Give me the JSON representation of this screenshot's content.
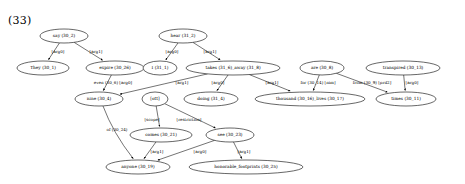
{
  "figure": {
    "example_number": "(33)",
    "type": "semantic-dependency-graph",
    "width": 465,
    "height": 184,
    "background": "#ffffff",
    "stroke_color": "#000000"
  },
  "nodes": [
    {
      "id": "say",
      "label": "say (30_2)",
      "cx": 64,
      "cy": 36,
      "rx": 24,
      "ry": 7
    },
    {
      "id": "hear",
      "label": "hear (31_2)",
      "cx": 183,
      "cy": 36,
      "rx": 24,
      "ry": 7
    },
    {
      "id": "they",
      "label": "They (30_1)",
      "cx": 43,
      "cy": 68,
      "rx": 26,
      "ry": 7
    },
    {
      "id": "expire",
      "label": "expire (30_26)",
      "cx": 115,
      "cy": 68,
      "rx": 29,
      "ry": 7
    },
    {
      "id": "i",
      "label": "I (31_1)",
      "cx": 160,
      "cy": 68,
      "rx": 17,
      "ry": 7
    },
    {
      "id": "takes_away",
      "label": "takes (31_6)_away (31_8)",
      "cx": 233,
      "cy": 68,
      "rx": 47,
      "ry": 7
    },
    {
      "id": "are",
      "label": "are (30_8)",
      "cx": 322,
      "cy": 68,
      "rx": 22,
      "ry": 7
    },
    {
      "id": "transpired",
      "label": "transpired (30_13)",
      "cx": 403,
      "cy": 68,
      "rx": 37,
      "ry": 7
    },
    {
      "id": "nine",
      "label": "nine (30_4)",
      "cx": 99,
      "cy": 99,
      "rx": 24,
      "ry": 7
    },
    {
      "id": "ott",
      "label": "[ott]",
      "cx": 155,
      "cy": 99,
      "rx": 13,
      "ry": 7
    },
    {
      "id": "doing",
      "label": "doing (31_4)",
      "cx": 211,
      "cy": 99,
      "rx": 27,
      "ry": 7
    },
    {
      "id": "thousand",
      "label": "thousand (30_16)_lives (30_17)",
      "cx": 310,
      "cy": 99,
      "rx": 55,
      "ry": 7
    },
    {
      "id": "times",
      "label": "times (30_11)",
      "cx": 406,
      "cy": 99,
      "rx": 30,
      "ry": 7
    },
    {
      "id": "comes",
      "label": "comes (30_21)",
      "cx": 161,
      "cy": 135,
      "rx": 31,
      "ry": 7
    },
    {
      "id": "see",
      "label": "see (30_23)",
      "cx": 230,
      "cy": 135,
      "rx": 24,
      "ry": 7
    },
    {
      "id": "anyone",
      "label": "anyone (30_19)",
      "cx": 138,
      "cy": 167,
      "rx": 32,
      "ry": 7
    },
    {
      "id": "footprints",
      "label": "honorable_footprints (30_25)",
      "cx": 246,
      "cy": 167,
      "rx": 57,
      "ry": 7
    }
  ],
  "edges": [
    {
      "from": "say",
      "to": "they",
      "label": "[arg0]",
      "lx": 58,
      "ly": 52
    },
    {
      "from": "say",
      "to": "expire",
      "label": "[arg1]",
      "lx": 96,
      "ly": 52
    },
    {
      "from": "hear",
      "to": "i",
      "label": "[arg0]",
      "lx": 172,
      "ly": 52
    },
    {
      "from": "hear",
      "to": "takes_away",
      "label": "[arg1]",
      "lx": 210,
      "ly": 52
    },
    {
      "from": "expire",
      "to": "nine",
      "label": "even (30_6) [arg0]",
      "lx": 113,
      "ly": 83
    },
    {
      "from": "takes_away",
      "to": "nine",
      "label": "[arg1]",
      "lx": 182,
      "ly": 83
    },
    {
      "from": "takes_away",
      "to": "doing",
      "label": "[arg0]",
      "lx": 218,
      "ly": 83
    },
    {
      "from": "takes_away",
      "to": "thousand",
      "label": "[arg1]",
      "lx": 272,
      "ly": 83
    },
    {
      "from": "are",
      "to": "thousand",
      "label": "for (30_14) [nim]",
      "lx": 318,
      "ly": 83
    },
    {
      "from": "are",
      "to": "times",
      "label": "from (30_9) [prd2]",
      "lx": 372,
      "ly": 83
    },
    {
      "from": "transpired",
      "to": "times",
      "label": "[arg0]",
      "lx": 412,
      "ly": 83
    },
    {
      "from": "nine",
      "to": "anyone",
      "label": "of (30_24)",
      "lx": 117,
      "ly": 130
    },
    {
      "from": "ott",
      "to": "comes",
      "label": "[scope]",
      "lx": 152,
      "ly": 120
    },
    {
      "from": "ott",
      "to": "see",
      "label": "[restriction]",
      "lx": 189,
      "ly": 120
    },
    {
      "from": "comes",
      "to": "anyone",
      "label": "[arg1]",
      "lx": 157,
      "ly": 152
    },
    {
      "from": "see",
      "to": "anyone",
      "label": "[arg0]",
      "lx": 200,
      "ly": 152
    },
    {
      "from": "see",
      "to": "footprints",
      "label": "[arg1]",
      "lx": 244,
      "ly": 152
    }
  ]
}
